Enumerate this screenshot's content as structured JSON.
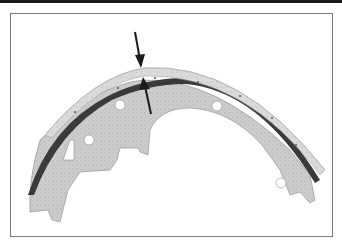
{
  "figure": {
    "colors": {
      "frame_border": "#7a7a7a",
      "top_rule": "#1a1a1a",
      "shoe_web": "#cfcfcf",
      "shoe_lining": "#d8d8d8",
      "shoe_rim_dark": "#3a3a3a",
      "arrow": "#1a1a1a",
      "background": "#ffffff"
    },
    "annotations": [
      {
        "type": "arrow",
        "direction": "down",
        "meaning": "lining-outer-surface"
      },
      {
        "type": "arrow",
        "direction": "up",
        "meaning": "lining-inner-surface"
      }
    ]
  }
}
